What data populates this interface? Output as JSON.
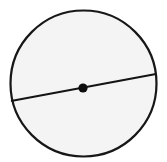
{
  "figure": {
    "type": "geometry-diagram",
    "canvas": {
      "width": 167,
      "height": 162,
      "background_color": "#ffffff"
    },
    "circle": {
      "name": "circle-outline",
      "center_x": 83.5,
      "center_y": 83.5,
      "radius": 73,
      "fill_color": "#f4f4f4",
      "stroke_color": "#171717",
      "stroke_width": 2.2
    },
    "diameter_line": {
      "name": "diameter-chord",
      "x1": 11,
      "y1": 101,
      "x2": 156,
      "y2": 74,
      "stroke_color": "#141414",
      "stroke_width": 2.2
    },
    "center_point": {
      "name": "center-dot",
      "cx": 83,
      "cy": 88,
      "radius": 4.6,
      "fill_color": "#0d0d0d"
    },
    "labels": []
  }
}
